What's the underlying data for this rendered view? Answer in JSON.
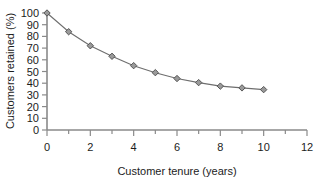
{
  "chart_data": {
    "type": "line",
    "title": "",
    "xlabel": "Customer tenure (years)",
    "ylabel": "Customers retained (%)",
    "xlim": [
      0,
      12
    ],
    "ylim": [
      0,
      100
    ],
    "grid": false,
    "legend": null,
    "x": [
      0,
      1,
      2,
      3,
      4,
      5,
      6,
      7,
      8,
      9,
      10
    ],
    "values": [
      100,
      84,
      72,
      63,
      55,
      49,
      44,
      40.5,
      37.5,
      36,
      34.5
    ],
    "series": [
      {
        "name": "Customers retained",
        "marker": "diamond",
        "marker_color": "#9a9a9a",
        "line_color": "#6e6e6e",
        "values": [
          100,
          84,
          72,
          63,
          55,
          49,
          44,
          40.5,
          37.5,
          36,
          34.5
        ]
      }
    ],
    "x_ticks": [
      0,
      2,
      4,
      6,
      8,
      10,
      12
    ],
    "x_tick_labels": [
      "0",
      "2",
      "4",
      "6",
      "8",
      "10",
      "12"
    ],
    "x_minor_ticks": [
      1,
      3,
      5,
      7,
      9,
      11
    ],
    "y_ticks": [
      0,
      10,
      20,
      30,
      40,
      50,
      60,
      70,
      80,
      90,
      100
    ],
    "y_tick_labels": [
      "0",
      "10",
      "20",
      "30",
      "40",
      "50",
      "60",
      "70",
      "80",
      "90",
      "100"
    ]
  },
  "axes": {
    "x_title": "Customer tenure (years)",
    "y_title": "Customers retained (%)"
  },
  "colors": {
    "axis": "#8a8a8a",
    "line": "#6e6e6e",
    "marker_fill": "#9a9a9a",
    "marker_stroke": "#4a4a4a",
    "text": "#1c1c1c",
    "background": "#ffffff"
  }
}
